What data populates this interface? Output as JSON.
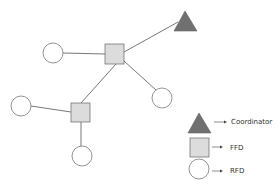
{
  "diagram": {
    "type": "network-topology",
    "colors": {
      "coordinator": "#707070",
      "ffd": "#dcdcdc",
      "rfd": "#ffffff",
      "stroke": "#555555"
    },
    "nodes": [
      {
        "id": "coordinator",
        "kind": "coordinator"
      },
      {
        "id": "ffd1",
        "kind": "ffd"
      },
      {
        "id": "ffd2",
        "kind": "ffd"
      },
      {
        "id": "rfd1",
        "kind": "rfd"
      },
      {
        "id": "rfd2",
        "kind": "rfd"
      },
      {
        "id": "rfd3",
        "kind": "rfd"
      },
      {
        "id": "rfd4",
        "kind": "rfd"
      }
    ],
    "edges": [
      [
        "ffd1",
        "coordinator"
      ],
      [
        "ffd1",
        "rfd1"
      ],
      [
        "ffd1",
        "rfd2"
      ],
      [
        "ffd1",
        "ffd2"
      ],
      [
        "ffd2",
        "rfd3"
      ],
      [
        "ffd2",
        "rfd4"
      ]
    ]
  },
  "legend": {
    "items": [
      {
        "shape": "triangle",
        "label": "Coordinator"
      },
      {
        "shape": "square",
        "label": "FFD"
      },
      {
        "shape": "circle",
        "label": "RFD"
      }
    ]
  }
}
